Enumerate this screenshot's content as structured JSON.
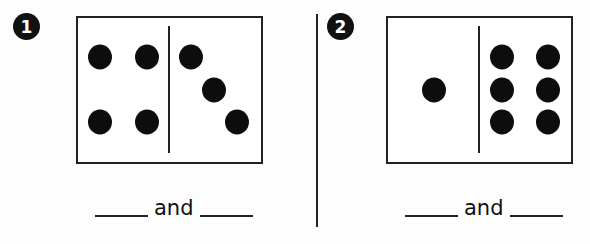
{
  "problems": [
    {
      "number": "1",
      "left_count_dots": 4,
      "right_count_dots": 3,
      "answer": {
        "connector": "and",
        "blank_left": "",
        "blank_right": ""
      }
    },
    {
      "number": "2",
      "left_count_dots": 1,
      "right_count_dots": 6,
      "answer": {
        "connector": "and",
        "blank_left": "",
        "blank_right": ""
      }
    }
  ],
  "colors": {
    "ink": "#111111",
    "background": "#fdfdfd"
  }
}
